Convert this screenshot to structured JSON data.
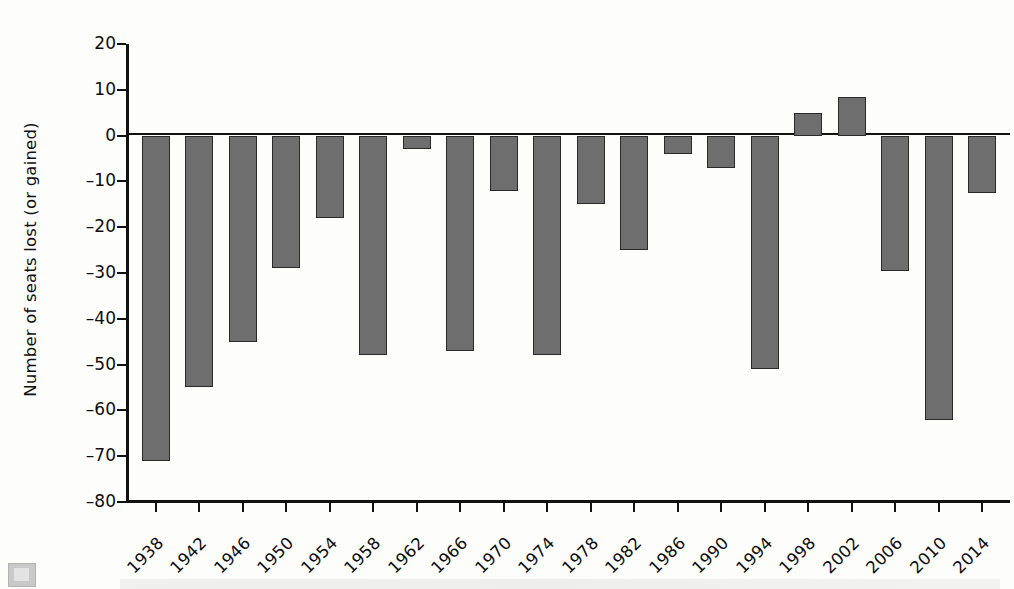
{
  "chart_data": {
    "type": "bar",
    "title": "",
    "subtitle": "",
    "xlabel": "",
    "ylabel": "Number of seats lost (or gained)",
    "ylim": [
      -80,
      20
    ],
    "yticks": [
      20,
      10,
      0,
      -10,
      -20,
      -30,
      -40,
      -50,
      -60,
      -70,
      -80
    ],
    "ytick_labels": [
      "20",
      "10",
      "0",
      "–10",
      "–20",
      "–30",
      "–40",
      "–50",
      "–60",
      "–70",
      "–80"
    ],
    "grid": false,
    "legend": null,
    "bar_color": "#6e6e6e",
    "bar_edge_color": "#2a2a2a",
    "zero_line": true,
    "categories": [
      "1938",
      "1942",
      "1946",
      "1950",
      "1954",
      "1958",
      "1962",
      "1966",
      "1970",
      "1974",
      "1978",
      "1982",
      "1986",
      "1990",
      "1994",
      "1998",
      "2002",
      "2006",
      "2010",
      "2014"
    ],
    "values": [
      -71,
      -55,
      -45,
      -29,
      -18,
      -48,
      -3,
      -47,
      -12,
      -48,
      -15,
      -25,
      -4,
      -7,
      -51,
      5,
      8.5,
      -29.5,
      -62,
      -12.5
    ],
    "xtick_labels": [
      "1938",
      "1942",
      "1946",
      "1950",
      "1954",
      "1958",
      "1962",
      "1966",
      "1970",
      "1974",
      "1978",
      "1982",
      "1986",
      "1990",
      "1994",
      "1998",
      "2002",
      "2006",
      "2010",
      "2014"
    ]
  }
}
